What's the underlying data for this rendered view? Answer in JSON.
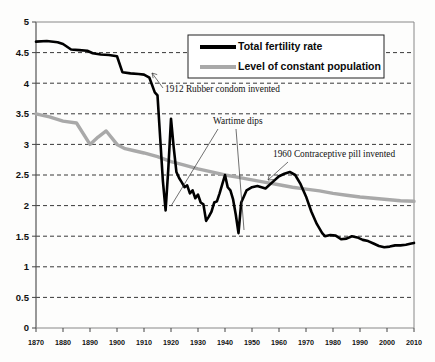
{
  "chart_data": {
    "type": "line",
    "title": "",
    "xlabel": "",
    "ylabel": "",
    "xlim": [
      1870,
      2010
    ],
    "ylim": [
      0,
      5
    ],
    "grid": true,
    "grid_style": "horizontal dashed",
    "legend_position": "top-right inside plot",
    "xticks": [
      1870,
      1880,
      1890,
      1900,
      1910,
      1920,
      1930,
      1940,
      1950,
      1960,
      1970,
      1980,
      1990,
      2000,
      2010
    ],
    "xtick_labels": [
      "1870",
      "1880",
      "1890",
      "1900",
      "1910",
      "1920",
      "1930",
      "1940",
      "1950",
      "1960",
      "1970",
      "1980",
      "1990",
      "2000",
      "2010"
    ],
    "yticks": [
      0,
      0.5,
      1,
      1.5,
      2,
      2.5,
      3,
      3.5,
      4,
      4.5,
      5
    ],
    "ytick_labels": [
      "0",
      "0.5",
      "1",
      "1.5",
      "2",
      "2.5",
      "3",
      "3.5",
      "4",
      "4.5",
      "5"
    ],
    "series": [
      {
        "name": "Total fertility rate",
        "color": "#000000",
        "style": "solid-thick",
        "x": [
          1870,
          1874,
          1878,
          1880,
          1883,
          1886,
          1889,
          1891,
          1894,
          1897,
          1900,
          1902,
          1905,
          1908,
          1910,
          1912,
          1914,
          1915,
          1916,
          1917,
          1918,
          1919,
          1920,
          1921,
          1922,
          1923,
          1924,
          1925,
          1926,
          1927,
          1928,
          1929,
          1930,
          1931,
          1932,
          1933,
          1934,
          1935,
          1936,
          1937,
          1938,
          1939,
          1940,
          1941,
          1942,
          1943,
          1944,
          1945,
          1946,
          1947,
          1948,
          1950,
          1952,
          1955,
          1958,
          1960,
          1962,
          1964,
          1966,
          1968,
          1970,
          1972,
          1974,
          1976,
          1977,
          1979,
          1981,
          1983,
          1985,
          1987,
          1989,
          1991,
          1993,
          1995,
          1997,
          1999,
          2001,
          2003,
          2005,
          2007,
          2009,
          2010
        ],
        "y": [
          4.68,
          4.69,
          4.67,
          4.64,
          4.55,
          4.54,
          4.53,
          4.49,
          4.47,
          4.46,
          4.44,
          4.18,
          4.16,
          4.15,
          4.14,
          4.09,
          3.85,
          3.8,
          3.1,
          2.4,
          1.92,
          2.6,
          3.42,
          2.95,
          2.55,
          2.45,
          2.38,
          2.3,
          2.33,
          2.2,
          2.25,
          2.12,
          2.18,
          2.05,
          2.02,
          1.75,
          1.82,
          1.9,
          2.05,
          2.07,
          2.2,
          2.35,
          2.5,
          2.3,
          2.25,
          2.1,
          1.85,
          1.55,
          2.05,
          2.15,
          2.25,
          2.3,
          2.32,
          2.28,
          2.4,
          2.48,
          2.52,
          2.55,
          2.5,
          2.35,
          2.15,
          1.9,
          1.7,
          1.55,
          1.5,
          1.52,
          1.51,
          1.45,
          1.46,
          1.5,
          1.48,
          1.44,
          1.42,
          1.38,
          1.34,
          1.32,
          1.33,
          1.35,
          1.35,
          1.36,
          1.38,
          1.39
        ]
      },
      {
        "name": "Level of constant population",
        "color": "#a9a9a9",
        "style": "solid-thick",
        "x": [
          1870,
          1875,
          1880,
          1885,
          1890,
          1893,
          1896,
          1900,
          1903,
          1906,
          1910,
          1915,
          1920,
          1925,
          1930,
          1935,
          1940,
          1945,
          1950,
          1955,
          1960,
          1965,
          1970,
          1975,
          1980,
          1985,
          1990,
          1995,
          2000,
          2005,
          2010
        ],
        "y": [
          3.5,
          3.45,
          3.38,
          3.35,
          3.0,
          3.12,
          3.22,
          3.0,
          2.93,
          2.9,
          2.86,
          2.8,
          2.72,
          2.66,
          2.6,
          2.55,
          2.5,
          2.46,
          2.42,
          2.38,
          2.34,
          2.3,
          2.27,
          2.24,
          2.2,
          2.17,
          2.14,
          2.12,
          2.1,
          2.08,
          2.07
        ]
      }
    ],
    "annotations": [
      {
        "text": "1912 Rubber condom invented",
        "points_to_year": 1912,
        "points_to_value": 4.15
      },
      {
        "text": "Wartime dips",
        "points_to_years": [
          1918,
          1945
        ],
        "points_to_values": [
          1.92,
          1.55
        ]
      },
      {
        "text": "1960 Contraceptive pill invented",
        "points_to_year": 1964,
        "points_to_value": 2.55
      }
    ]
  },
  "legend": {
    "items": [
      {
        "label": "Total fertility rate",
        "color": "#000000"
      },
      {
        "label": "Level of constant population",
        "color": "#a9a9a9"
      }
    ]
  }
}
